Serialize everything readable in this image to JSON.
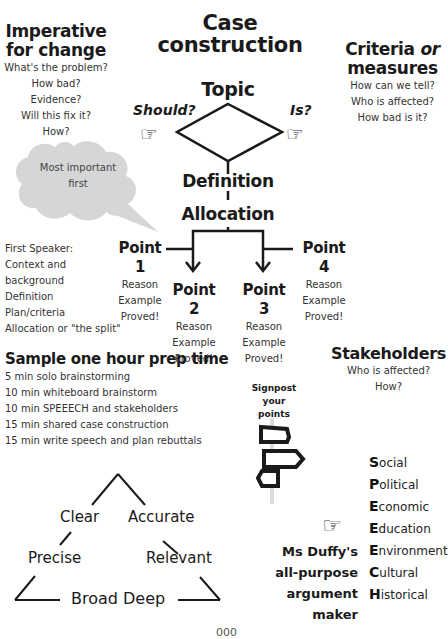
{
  "title": {
    "line1": "Case",
    "line2": "construction"
  },
  "imperative": {
    "heading_line1": "Imperative",
    "heading_line2": "for change",
    "questions": [
      "What's the problem?",
      "How bad?",
      "Evidence?",
      "Will this fix it?",
      "How?"
    ]
  },
  "criteria": {
    "heading_word1": "Criteria",
    "heading_or": "or",
    "heading_line2": "measures",
    "questions": [
      "How can we tell?",
      "Who is affected?",
      "How bad is it?"
    ]
  },
  "flow": {
    "topic": "Topic",
    "should": "Should?",
    "is": "Is?",
    "definition": "Definition",
    "allocation": "Allocation",
    "points": [
      {
        "label": "Point 1",
        "items": [
          "Reason",
          "Example",
          "Proved!"
        ]
      },
      {
        "label": "Point 2",
        "items": [
          "Reason",
          "Example",
          "Proved!"
        ]
      },
      {
        "label": "Point 3",
        "items": [
          "Reason",
          "Example",
          "Proved!"
        ]
      },
      {
        "label": "Point 4",
        "items": [
          "Reason",
          "Example",
          "Proved!"
        ]
      }
    ]
  },
  "bubble": {
    "line1": "Most important",
    "line2": "first"
  },
  "first_speaker": {
    "lines": [
      "First Speaker:",
      "Context and",
      "background",
      "Definition",
      "Plan/criteria",
      "Allocation or \"the split\""
    ]
  },
  "prep": {
    "heading": "Sample one hour prep time",
    "items": [
      "5 min solo brainstorming",
      "10 min whiteboard brainstorm",
      "10 min SPEEECH and stakeholders",
      "15 min shared case construction",
      "15 min write speech and plan rebuttals"
    ]
  },
  "stakeholders": {
    "heading": "Stakeholders",
    "questions": [
      "Who is affected?",
      "How?"
    ]
  },
  "signpost": {
    "line1": "Signpost",
    "line2": "your points"
  },
  "speeech": [
    {
      "cap": "S",
      "rest": "ocial"
    },
    {
      "cap": "P",
      "rest": "olitical"
    },
    {
      "cap": "E",
      "rest": "conomic"
    },
    {
      "cap": "E",
      "rest": "ducation"
    },
    {
      "cap": "E",
      "rest": "nvironment"
    },
    {
      "cap": "C",
      "rest": "ultural"
    },
    {
      "cap": "H",
      "rest": "istorical"
    }
  ],
  "argument_maker": {
    "lines": [
      "Ms Duffy's",
      "all-purpose",
      "argument",
      "maker"
    ]
  },
  "triangle": {
    "clear": "Clear",
    "accurate": "Accurate",
    "precise": "Precise",
    "relevant": "Relevant",
    "bottom": "Broad Deep"
  },
  "page_number": "000",
  "colors": {
    "ink": "#1a1a1a",
    "bubble": "#d6d6d6",
    "text_muted": "#333333"
  }
}
